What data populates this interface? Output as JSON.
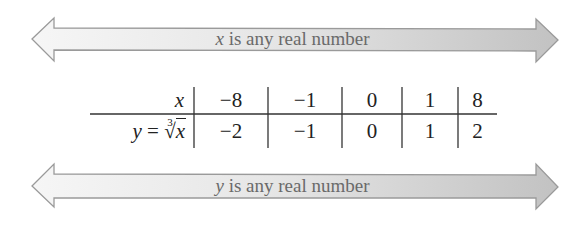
{
  "arrows": {
    "top": {
      "variable": "x",
      "text": " is any real number",
      "direction": "both"
    },
    "bottom": {
      "variable": "y",
      "text": " is any real number",
      "direction": "both"
    }
  },
  "colors": {
    "arrow_fill_light": "#f3f3f3",
    "arrow_fill_dark": "#c4c4c4",
    "arrow_stroke": "#9a9a9a",
    "arrow_text": "#6a6a6a",
    "table_text": "#222222",
    "table_lines": "#333333"
  },
  "table": {
    "row_headers": {
      "x": {
        "var": "x"
      },
      "y": {
        "lhs": "y",
        "eq": " = ",
        "root_index": "3",
        "root_sign": "√",
        "radicand": "x"
      }
    },
    "x_values": [
      "−8",
      "−1",
      "0",
      "1",
      "8"
    ],
    "y_values": [
      "−2",
      "−1",
      "0",
      "1",
      "2"
    ]
  }
}
